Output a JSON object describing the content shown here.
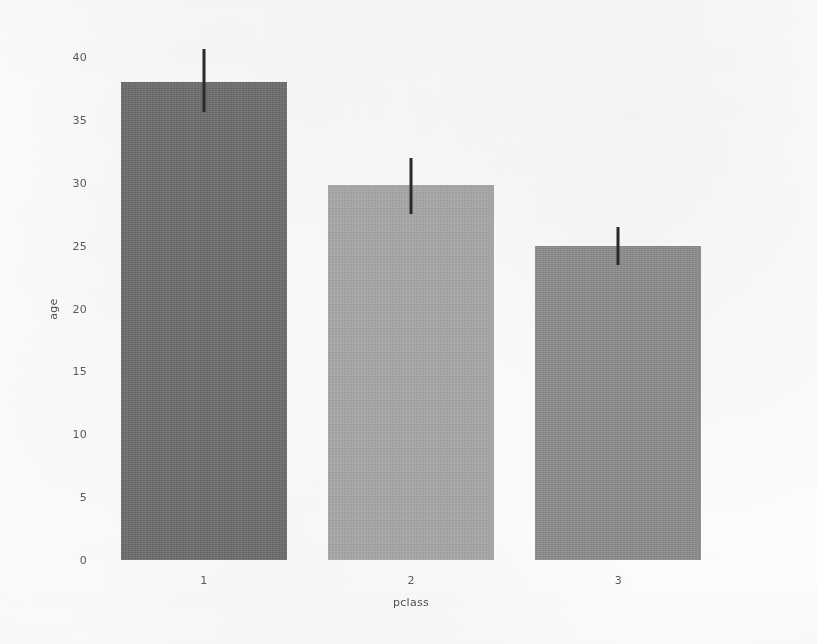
{
  "figure": {
    "background_color": "#ffffff",
    "width": 817,
    "height": 644
  },
  "chart_data": {
    "type": "bar",
    "title": "",
    "xlabel": "pclass",
    "ylabel": "age",
    "categories": [
      "1",
      "2",
      "3"
    ],
    "values": [
      38.0,
      29.8,
      25.0
    ],
    "errors_low": [
      35.6,
      27.5,
      23.5
    ],
    "errors_high": [
      40.6,
      32.0,
      26.5
    ],
    "series": [
      {
        "name": "mean age",
        "values": [
          38.0,
          29.8,
          25.0
        ]
      }
    ],
    "bar_colors": [
      "#6e6e6e",
      "#a8a8a8",
      "#8d8d8d"
    ],
    "errorbar_color": "#2a2a2a",
    "xlim": [
      0,
      3
    ],
    "ylim": [
      0,
      40
    ],
    "yticks": [
      0,
      5,
      10,
      15,
      20,
      25,
      30,
      35,
      40
    ],
    "ytick_labels": [
      "0",
      "5",
      "10",
      "15",
      "20",
      "25",
      "30",
      "35",
      "40"
    ],
    "xtick_labels": [
      "1",
      "2",
      "3"
    ],
    "grid": false,
    "legend": false,
    "legend_position": "none",
    "bars": [
      {
        "label": "1",
        "value": 38.0,
        "ci_low": 35.6,
        "ci_high": 40.6,
        "color": "#6e6e6e"
      },
      {
        "label": "2",
        "value": 29.8,
        "ci_low": 27.5,
        "ci_high": 32.0,
        "color": "#a8a8a8"
      },
      {
        "label": "3",
        "value": 25.0,
        "ci_low": 23.5,
        "ci_high": 26.5,
        "color": "#8d8d8d"
      }
    ]
  }
}
